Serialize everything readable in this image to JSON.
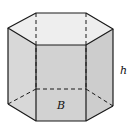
{
  "diagram": {
    "type": "hexagonal-prism",
    "labels": {
      "base": "B",
      "height": "h"
    },
    "colors": {
      "top_face": "#eeeeee",
      "side_face_left": "#d8d8d8",
      "side_face_front": "#d2d2d2",
      "side_face_right": "#cdcdcd",
      "edge": "#1a1a1a",
      "background": "#ffffff"
    },
    "vertices": {
      "top": {
        "back_left": [
          36,
          13
        ],
        "back_right": [
          86,
          13
        ],
        "right": [
          113,
          29
        ],
        "front_right": [
          86,
          45
        ],
        "front_left": [
          36,
          45
        ],
        "left": [
          8,
          28
        ]
      },
      "bottom": {
        "back_left": [
          36,
          89
        ],
        "back_right": [
          86,
          89
        ],
        "right": [
          113,
          106
        ],
        "front_right": [
          86,
          121
        ],
        "front_left": [
          36,
          121
        ],
        "left": [
          8,
          104
        ]
      }
    }
  }
}
